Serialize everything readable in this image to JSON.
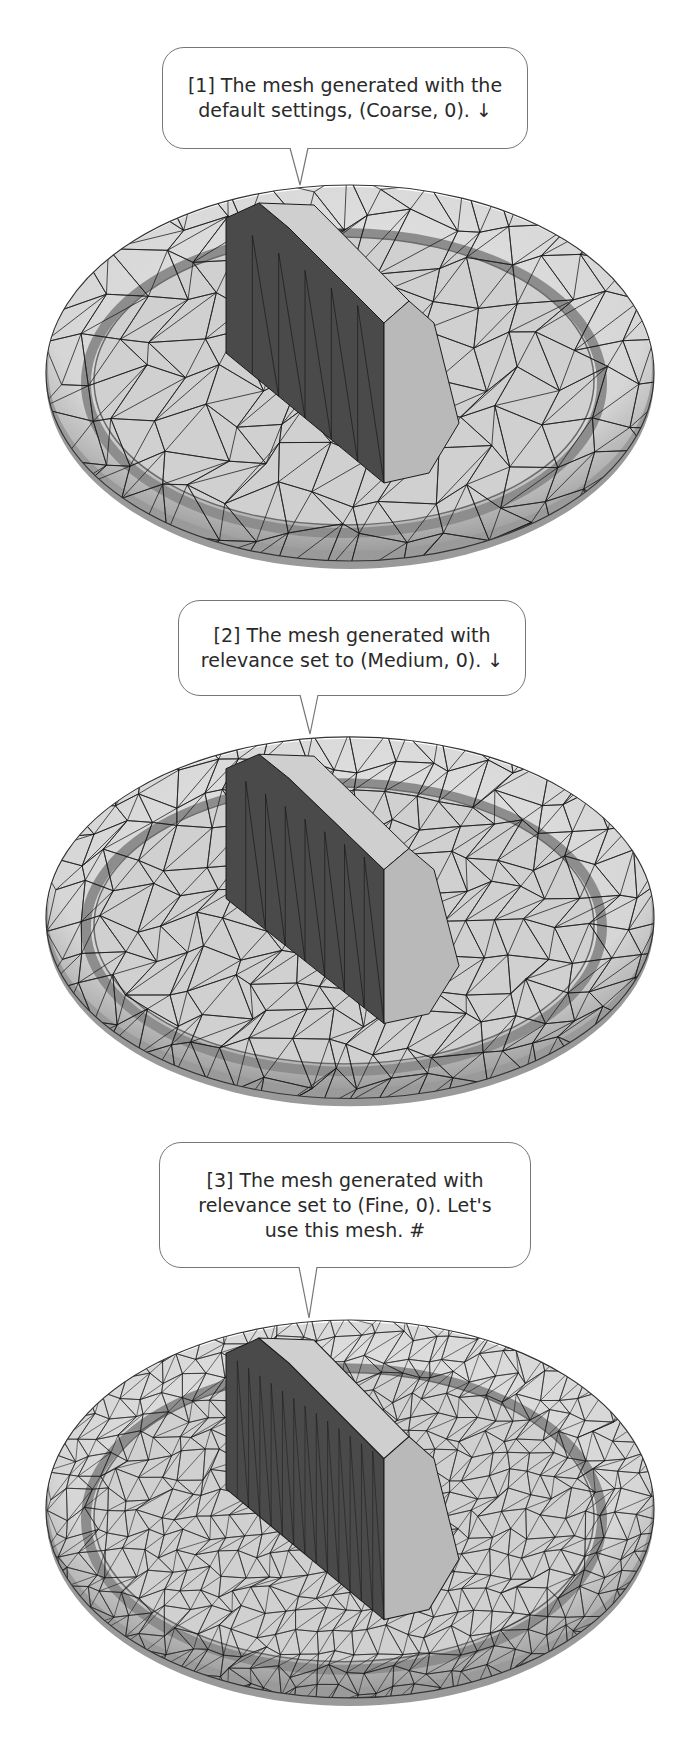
{
  "steps": [
    {
      "id": 1,
      "callout": "[1] The mesh generated with the\ndefault settings, (Coarse, 0).  ↓",
      "mesh_density": "Coarse",
      "mesh_relevance": 0,
      "continuation_icon": "down-arrow-icon"
    },
    {
      "id": 2,
      "callout": "[2] The mesh generated with\nrelevance set to (Medium, 0).  ↓",
      "mesh_density": "Medium",
      "mesh_relevance": 0,
      "continuation_icon": "down-arrow-icon"
    },
    {
      "id": 3,
      "callout": "[3] The mesh generated with\nrelevance set to (Fine, 0).  Let's\nuse this mesh.  #",
      "mesh_density": "Fine",
      "mesh_relevance": 0,
      "continuation_icon": "end-mark-icon"
    }
  ],
  "colors": {
    "mesh_light": "#d6d6d6",
    "mesh_mid": "#a9a9a9",
    "mesh_dark": "#4a4a4a",
    "wire": "#1a1a1a",
    "callout_border": "#777777"
  }
}
